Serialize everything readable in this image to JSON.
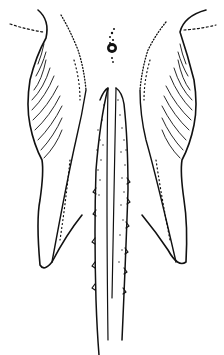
{
  "figure": {
    "type": "scientific line illustration",
    "colors": {
      "ink": "#111111",
      "background": "#ffffff"
    },
    "caption": ""
  }
}
